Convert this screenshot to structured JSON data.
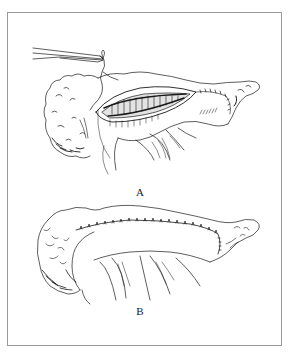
{
  "figure": {
    "panels": [
      {
        "label": "A",
        "description": "Pancreas with opened duct, forceps holding suture, partial suture line on right"
      },
      {
        "label": "B",
        "description": "Pancreas with completed continuous suture line along anterior surface"
      }
    ]
  },
  "colors": {
    "line": "#1a1a1a",
    "border": "#9a9a9a",
    "background": "#ffffff"
  }
}
